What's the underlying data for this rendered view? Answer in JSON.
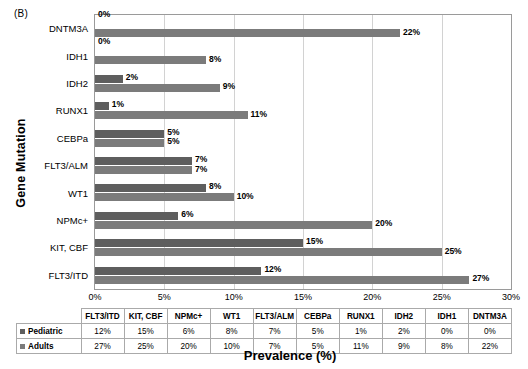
{
  "panel_label": "(B)",
  "axis_titles": {
    "y": "Gene Mutation",
    "x": "Prevalence (%)"
  },
  "colors": {
    "pediatric_bar": "#5e5e5e",
    "adults_bar": "#7b7b7b",
    "gridline": "#d2d2d2",
    "plot_border": "#9a9a9a"
  },
  "chart_data": {
    "type": "bar",
    "orientation": "horizontal",
    "title": "(B)",
    "xlabel": "Prevalence (%)",
    "ylabel": "Gene Mutation",
    "xlim": [
      0,
      30
    ],
    "xticks": [
      "0%",
      "5%",
      "10%",
      "15%",
      "20%",
      "25%",
      "30%"
    ],
    "xtick_values": [
      0,
      5,
      10,
      15,
      20,
      25,
      30
    ],
    "grid": true,
    "legend_position": "table-below",
    "categories": [
      "FLT3/ITD",
      "KIT, CBF",
      "NPMc+",
      "WT1",
      "FLT3/ALM",
      "CEBPa",
      "RUNX1",
      "IDH2",
      "IDH1",
      "DNTM3A"
    ],
    "categories_top_to_bottom": [
      "DNTM3A",
      "IDH1",
      "IDH2",
      "RUNX1",
      "CEBPa",
      "FLT3/ALM",
      "WT1",
      "NPMc+",
      "KIT, CBF",
      "FLT3/ITD"
    ],
    "series": [
      {
        "name": "Pediatric",
        "values": [
          12,
          15,
          6,
          8,
          7,
          5,
          1,
          2,
          0,
          0
        ],
        "labels": [
          "12%",
          "15%",
          "6%",
          "8%",
          "7%",
          "5%",
          "1%",
          "2%",
          "0%",
          "0%"
        ]
      },
      {
        "name": "Adults",
        "values": [
          27,
          25,
          20,
          10,
          7,
          5,
          11,
          9,
          8,
          22
        ],
        "labels": [
          "27%",
          "25%",
          "20%",
          "10%",
          "7%",
          "5%",
          "11%",
          "9%",
          "8%",
          "22%"
        ]
      }
    ]
  },
  "table": {
    "headers": [
      "FLT3/ITD",
      "KIT, CBF",
      "NPMc+",
      "WT1",
      "FLT3/ALM",
      "CEBPa",
      "RUNX1",
      "IDH2",
      "IDH1",
      "DNTM3A"
    ],
    "rows": [
      {
        "series": "Pediatric",
        "values": [
          "12%",
          "15%",
          "6%",
          "8%",
          "7%",
          "5%",
          "1%",
          "2%",
          "0%",
          "0%"
        ]
      },
      {
        "series": "Adults",
        "values": [
          "27%",
          "25%",
          "20%",
          "10%",
          "7%",
          "5%",
          "11%",
          "9%",
          "8%",
          "22%"
        ]
      }
    ]
  }
}
